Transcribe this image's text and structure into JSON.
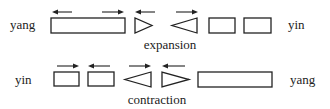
{
  "diagram": {
    "colors": {
      "ink": "#222222",
      "background": "#ffffff"
    },
    "rows": [
      {
        "id": "expansion",
        "left_label": "yang",
        "right_label": "yin",
        "caption": "expansion",
        "elements": [
          {
            "shape": "long-rectangle",
            "arrows": [
              "left",
              "right"
            ]
          },
          {
            "shape": "triangle-pointing-right",
            "arrows": [
              "left"
            ]
          },
          {
            "shape": "triangle-pointing-left",
            "arrows": [
              "right"
            ]
          },
          {
            "shape": "square",
            "arrows": []
          },
          {
            "shape": "square",
            "arrows": []
          }
        ]
      },
      {
        "id": "contraction",
        "left_label": "yin",
        "right_label": "yang",
        "caption": "contraction",
        "elements": [
          {
            "shape": "square",
            "arrows": [
              "right"
            ]
          },
          {
            "shape": "square",
            "arrows": [
              "left"
            ]
          },
          {
            "shape": "triangle-pointing-left",
            "arrows": [
              "right"
            ]
          },
          {
            "shape": "triangle-pointing-right",
            "arrows": [
              "left"
            ]
          },
          {
            "shape": "long-rectangle",
            "arrows": []
          }
        ]
      }
    ]
  }
}
